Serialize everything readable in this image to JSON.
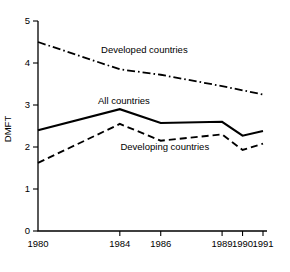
{
  "chart_data": {
    "type": "line",
    "title": "",
    "xlabel": "",
    "ylabel": "DMFT",
    "x": [
      1980,
      1984,
      1986,
      1989,
      1990,
      1991
    ],
    "xtick_labels": [
      "1980",
      "1984",
      "1986",
      "1989",
      "1990",
      "1991"
    ],
    "ytick_labels": [
      "0",
      "1",
      "2",
      "3",
      "4",
      "5"
    ],
    "yticks": [
      0,
      1,
      2,
      3,
      4,
      5
    ],
    "ylim": [
      0,
      5
    ],
    "xlim": [
      1980,
      1991
    ],
    "grid": false,
    "legend_position": "inline-annotations",
    "series": [
      {
        "name": "Developed countries",
        "style": "dash-dot",
        "color": "#000000",
        "values": [
          4.5,
          3.85,
          3.72,
          3.45,
          3.35,
          3.25
        ]
      },
      {
        "name": "All countries",
        "style": "solid",
        "color": "#000000",
        "values": [
          2.4,
          2.9,
          2.57,
          2.6,
          2.27,
          2.38
        ]
      },
      {
        "name": "Developing countries",
        "style": "dashed",
        "color": "#000000",
        "values": [
          1.62,
          2.55,
          2.15,
          2.3,
          1.93,
          2.08
        ]
      }
    ],
    "annotations": [
      {
        "text": "Developed countries",
        "x": 1985.2,
        "y": 4.23
      },
      {
        "text": "All countries",
        "x": 1984.2,
        "y": 3.02
      },
      {
        "text": "Developing countries",
        "x": 1986.2,
        "y": 1.92
      }
    ]
  }
}
